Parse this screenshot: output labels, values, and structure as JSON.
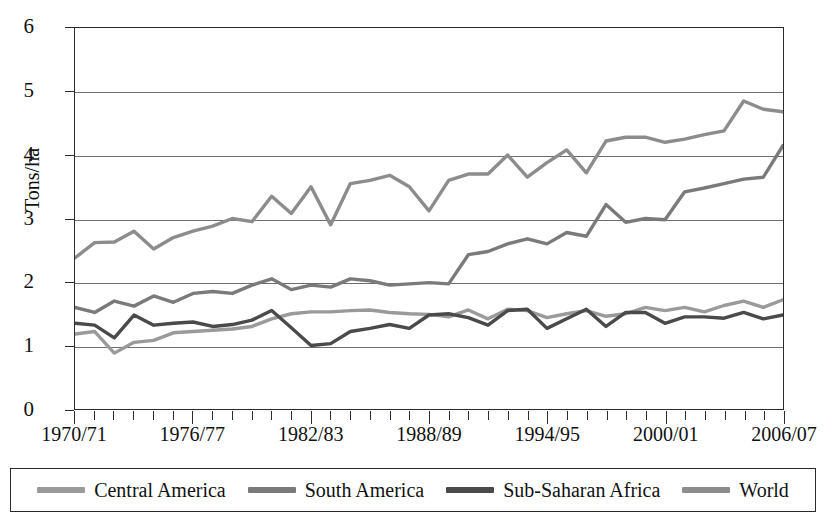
{
  "chart_data": {
    "type": "line",
    "title": "",
    "xlabel": "",
    "ylabel": "Tons/ha",
    "ylim": [
      0,
      6
    ],
    "yticks": [
      0,
      1,
      2,
      3,
      4,
      5,
      6
    ],
    "grid": true,
    "legend_position": "bottom",
    "x": [
      "1970/71",
      "1971/72",
      "1972/73",
      "1973/74",
      "1974/75",
      "1975/76",
      "1976/77",
      "1977/78",
      "1978/79",
      "1979/80",
      "1980/81",
      "1981/82",
      "1982/83",
      "1983/84",
      "1984/85",
      "1985/86",
      "1986/87",
      "1987/88",
      "1988/89",
      "1989/90",
      "1990/91",
      "1991/92",
      "1992/93",
      "1993/94",
      "1994/95",
      "1995/96",
      "1996/97",
      "1997/98",
      "1998/99",
      "1999/00",
      "2000/01",
      "2001/02",
      "2002/03",
      "2003/04",
      "2004/05",
      "2005/06",
      "2006/07"
    ],
    "xtick_labels": [
      "1970/71",
      "1976/77",
      "1982/83",
      "1988/89",
      "1994/95",
      "2000/01",
      "2006/07"
    ],
    "xtick_indices": [
      0,
      6,
      12,
      18,
      24,
      30,
      36
    ],
    "series": [
      {
        "name": "Central America",
        "color": "#9a9a9a",
        "values": [
          1.18,
          1.22,
          0.88,
          1.05,
          1.08,
          1.2,
          1.22,
          1.24,
          1.26,
          1.3,
          1.42,
          1.5,
          1.53,
          1.53,
          1.55,
          1.56,
          1.52,
          1.5,
          1.49,
          1.45,
          1.56,
          1.42,
          1.57,
          1.55,
          1.44,
          1.5,
          1.55,
          1.46,
          1.5,
          1.6,
          1.55,
          1.6,
          1.53,
          1.63,
          1.7,
          1.6,
          1.72
        ]
      },
      {
        "name": "South America",
        "color": "#7a7a7a",
        "values": [
          1.6,
          1.52,
          1.7,
          1.62,
          1.78,
          1.68,
          1.82,
          1.85,
          1.82,
          1.95,
          2.05,
          1.88,
          1.95,
          1.92,
          2.05,
          2.02,
          1.95,
          1.97,
          1.99,
          1.97,
          2.43,
          2.48,
          2.6,
          2.68,
          2.6,
          2.78,
          2.72,
          3.22,
          2.94,
          3.0,
          2.98,
          3.42,
          3.48,
          3.55,
          3.62,
          3.65,
          4.15
        ]
      },
      {
        "name": "Sub-Saharan Africa",
        "color": "#4a4a4a",
        "values": [
          1.35,
          1.32,
          1.12,
          1.48,
          1.32,
          1.35,
          1.37,
          1.3,
          1.33,
          1.4,
          1.55,
          1.28,
          1.0,
          1.03,
          1.22,
          1.27,
          1.33,
          1.27,
          1.48,
          1.5,
          1.44,
          1.32,
          1.55,
          1.57,
          1.27,
          1.42,
          1.57,
          1.3,
          1.52,
          1.52,
          1.35,
          1.45,
          1.45,
          1.43,
          1.52,
          1.42,
          1.48
        ]
      },
      {
        "name": "World",
        "color": "#8c8c8c",
        "values": [
          2.38,
          2.62,
          2.63,
          2.8,
          2.52,
          2.7,
          2.8,
          2.88,
          3.0,
          2.95,
          3.35,
          3.08,
          3.5,
          2.9,
          3.55,
          3.6,
          3.68,
          3.5,
          3.12,
          3.6,
          3.7,
          3.7,
          4.0,
          3.65,
          3.88,
          4.08,
          3.72,
          4.22,
          4.28,
          4.28,
          4.2,
          4.25,
          4.32,
          4.38,
          4.85,
          4.72,
          4.68
        ]
      }
    ]
  },
  "axis": {
    "y_title": "Tons/ha",
    "y_labels": [
      "0",
      "1",
      "2",
      "3",
      "4",
      "5",
      "6"
    ]
  },
  "legend": {
    "items": [
      {
        "label": "Central America",
        "color": "#9a9a9a"
      },
      {
        "label": "South America",
        "color": "#7a7a7a"
      },
      {
        "label": "Sub-Saharan Africa",
        "color": "#4a4a4a"
      },
      {
        "label": "World",
        "color": "#8c8c8c"
      }
    ]
  }
}
